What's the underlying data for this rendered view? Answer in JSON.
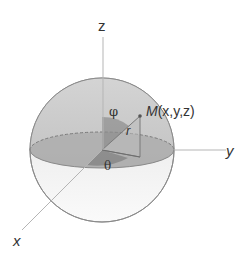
{
  "diagram": {
    "type": "spherical-coordinates",
    "labels": {
      "z_axis": "z",
      "y_axis": "y",
      "x_axis": "x",
      "point": "M(x,y,z)",
      "point_letter": "M",
      "point_coords": "(x,y,z)",
      "polar_angle": "φ",
      "azimuth_angle": "θ",
      "radius": "r"
    },
    "colors": {
      "sphere_upper": "#c8c8c8",
      "sphere_lower": "#f0f0f0",
      "equator_plane": "#a8a8a8",
      "outline": "#8a8a8a",
      "axis": "#b0b0b0",
      "triangle": "#7a7a7a",
      "text": "#333333"
    }
  }
}
